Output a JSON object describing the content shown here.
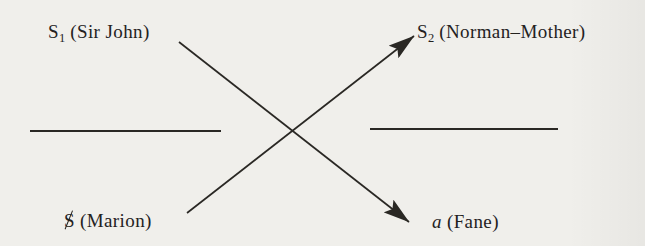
{
  "page": {
    "background": "#f0efeb",
    "ink": "#24221e"
  },
  "diagram": {
    "kind": "schema-crossing-diagram",
    "nodes": {
      "top_left": {
        "symbol": "S",
        "subscript": "1",
        "annotation": "(Sir John)"
      },
      "top_right": {
        "symbol": "S",
        "subscript": "2",
        "annotation": "(Norman–Mother)"
      },
      "bottom_left": {
        "symbol": "S",
        "barred": true,
        "annotation": "(Marion)"
      },
      "bottom_right": {
        "symbol": "a",
        "italic": true,
        "annotation": "(Fane)"
      }
    },
    "edges": [
      {
        "from": "bottom_left",
        "to": "top_right",
        "arrowhead": "end"
      },
      {
        "from": "top_left",
        "to": "bottom_right",
        "arrowhead": "end"
      }
    ],
    "divider_lines": [
      {
        "side": "left"
      },
      {
        "side": "right"
      }
    ]
  }
}
